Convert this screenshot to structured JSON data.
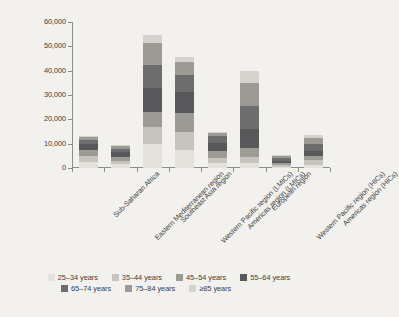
{
  "chart_data": {
    "type": "bar",
    "stacked": true,
    "title": "",
    "xlabel": "",
    "ylabel": "People with peripheral artery\ndisease (thousands)",
    "ylim": [
      0,
      60000
    ],
    "ytick_labels": [
      "0",
      "10,000",
      "20,000",
      "30,000",
      "40,000",
      "50,000",
      "60,000"
    ],
    "ytick_values": [
      0,
      10000,
      20000,
      30000,
      40000,
      50000,
      60000
    ],
    "grid": false,
    "legend_position": "bottom",
    "categories": [
      "Sub-Saharan Africa",
      "Eastern Mediterranean region",
      "Southeast Asia region",
      "Western Pacific region (LMICs)",
      "Americas region (LMICs)",
      "European region",
      "Western Pacific region (HICs)",
      "Americas region (HICs)"
    ],
    "series": [
      {
        "name": "25–34 years",
        "color": "#e3e1dc",
        "values": [
          2600,
          1500,
          9900,
          7200,
          2000,
          1900,
          500,
          1400
        ]
      },
      {
        "name": "35–44 years",
        "color": "#c6c4bf",
        "values": [
          2400,
          1400,
          6900,
          7600,
          2300,
          2500,
          600,
          1700
        ]
      },
      {
        "name": "45–54 years",
        "color": "#9d9b96",
        "values": [
          2500,
          1700,
          6200,
          7700,
          2800,
          3900,
          800,
          1800
        ]
      },
      {
        "name": "55–64 years",
        "color": "#58585a",
        "values": [
          2300,
          1800,
          9900,
          8600,
          3300,
          7700,
          1100,
          2200
        ]
      },
      {
        "name": "65–74 years",
        "color": "#6e6d6d",
        "values": [
          1800,
          1600,
          9600,
          7300,
          2600,
          9700,
          1100,
          2600
        ]
      },
      {
        "name": "75–84 years",
        "color": "#9b9a95",
        "values": [
          1100,
          1100,
          9000,
          5200,
          1600,
          9100,
          1000,
          2500
        ]
      },
      {
        "name": "≥85 years",
        "color": "#d5d3ce",
        "values": [
          300,
          400,
          3000,
          1900,
          400,
          5200,
          400,
          1300
        ]
      }
    ],
    "totals": [
      13000,
      9500,
      54500,
      45500,
      15000,
      40000,
      5500,
      13500
    ]
  }
}
